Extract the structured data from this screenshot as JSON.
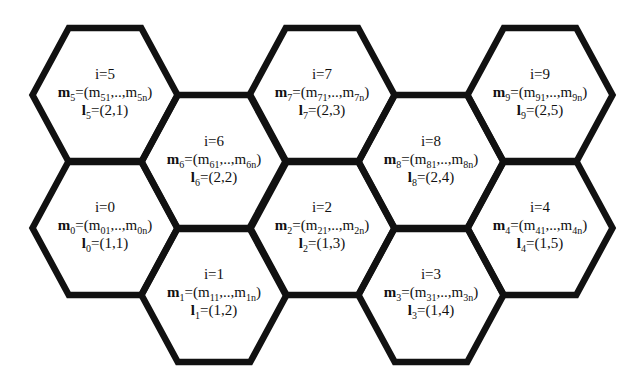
{
  "diagram": {
    "title": "",
    "stroke_color": "#111111",
    "background": "#ffffff",
    "stroke_width": 6.5,
    "hex_half_width": 72.5,
    "hex_half_height": 67,
    "cells": [
      {
        "i": "5",
        "index_label": "i=5",
        "m_sub": "5",
        "m_first": "51",
        "m_last": "5n",
        "l_sub": "5",
        "l_value": "=(2,1)",
        "cx": 105,
        "cy": 95
      },
      {
        "i": "6",
        "index_label": "i=6",
        "m_sub": "6",
        "m_first": "61",
        "m_last": "6n",
        "l_sub": "6",
        "l_value": "=(2,2)",
        "cx": 214,
        "cy": 162
      },
      {
        "i": "7",
        "index_label": "i=7",
        "m_sub": "7",
        "m_first": "71",
        "m_last": "7n",
        "l_sub": "7",
        "l_value": "=(2,3)",
        "cx": 322,
        "cy": 95
      },
      {
        "i": "8",
        "index_label": "i=8",
        "m_sub": "8",
        "m_first": "81",
        "m_last": "8n",
        "l_sub": "8",
        "l_value": "=(2,4)",
        "cx": 431,
        "cy": 162
      },
      {
        "i": "9",
        "index_label": "i=9",
        "m_sub": "9",
        "m_first": "91",
        "m_last": "9n",
        "l_sub": "9",
        "l_value": "=(2,5)",
        "cx": 540,
        "cy": 95
      },
      {
        "i": "0",
        "index_label": "i=0",
        "m_sub": "0",
        "m_first": "01",
        "m_last": "0n",
        "l_sub": "0",
        "l_value": "=(1,1)",
        "cx": 105,
        "cy": 228
      },
      {
        "i": "1",
        "index_label": "i=1",
        "m_sub": "1",
        "m_first": "11",
        "m_last": "1n",
        "l_sub": "1",
        "l_value": "=(1,2)",
        "cx": 214,
        "cy": 295
      },
      {
        "i": "2",
        "index_label": "i=2",
        "m_sub": "2",
        "m_first": "21",
        "m_last": "2n",
        "l_sub": "2",
        "l_value": "=(1,3)",
        "cx": 322,
        "cy": 228
      },
      {
        "i": "3",
        "index_label": "i=3",
        "m_sub": "3",
        "m_first": "31",
        "m_last": "3n",
        "l_sub": "3",
        "l_value": "=(1,4)",
        "cx": 431,
        "cy": 295
      },
      {
        "i": "4",
        "index_label": "i=4",
        "m_sub": "4",
        "m_first": "41",
        "m_last": "4n",
        "l_sub": "4",
        "l_value": "=(1,5)",
        "cx": 540,
        "cy": 228
      }
    ],
    "symbols": {
      "m": "m",
      "l": "l",
      "eq_open": "=(m",
      "ellipsis": ",..,m",
      "close": ")"
    }
  }
}
